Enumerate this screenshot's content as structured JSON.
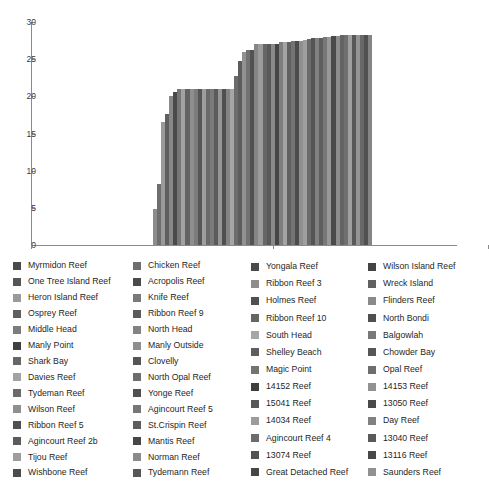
{
  "chart_data": {
    "type": "bar",
    "title": "",
    "subtitle": "",
    "xlabel": "",
    "ylabel": "",
    "ylim": [
      0,
      30
    ],
    "yticks": [
      0,
      5,
      10,
      15,
      20,
      25,
      30
    ],
    "grid": false,
    "legend_position": "bottom",
    "legend_columns": 4,
    "x_axis_tick_positions": [
      0,
      242,
      457
    ],
    "categories": [
      "Myrmidon Reef",
      "One Tree Island Reef",
      "Heron Island Reef",
      "Osprey Reef",
      "Middle Head",
      "Manly Point",
      "Shark Bay",
      "Davies Reef",
      "Tydeman Reef",
      "Wilson Reef",
      "Ribbon Reef 5",
      "Agincourt Reef 2b",
      "Tijou Reef",
      "Wishbone Reef",
      "Chicken Reef",
      "Acropolis Reef",
      "Knife Reef",
      "Ribbon Reef 9",
      "North Head",
      "Manly Outside",
      "Clovelly",
      "North Opal Reef",
      "Yonge Reef",
      "Agincourt Reef 5",
      "St.Crispin Reef",
      "Mantis Reef",
      "Norman Reef",
      "Tydemann Reef",
      "Yongala Reef",
      "Ribbon Reef 3",
      "Holmes Reef",
      "Ribbon Reef 10",
      "South Head",
      "Shelley Beach",
      "Magic Point",
      "14152 Reef",
      "15041 Reef",
      "14034 Reef",
      "Agincourt Reef 4",
      "13074 Reef",
      "Great Detached Reef",
      "Wilson Island Reef",
      "Wreck Island",
      "Flinders Reef",
      "North Bondi",
      "Balgowlah",
      "Chowder Bay",
      "Opal Reef",
      "14153 Reef",
      "13050 Reef",
      "Day Reef",
      "13040 Reef",
      "13116 Reef",
      "Saunders Reef"
    ],
    "values": [
      4.9,
      8.2,
      16.5,
      17.6,
      20.1,
      20.6,
      21.0,
      21.0,
      21.0,
      21.0,
      21.0,
      21.0,
      21.0,
      21.0,
      21.0,
      21.0,
      21.0,
      21.0,
      21.0,
      21.0,
      22.7,
      24.7,
      26.0,
      26.2,
      26.2,
      27.1,
      27.1,
      27.1,
      27.1,
      27.1,
      27.1,
      27.3,
      27.3,
      27.3,
      27.4,
      27.4,
      27.5,
      27.6,
      27.7,
      27.8,
      27.9,
      27.9,
      28.0,
      28.0,
      28.1,
      28.1,
      28.2,
      28.2,
      28.2,
      28.2,
      28.2,
      28.2,
      28.2,
      28.2
    ],
    "bar_colors": [
      "#8c8c8c",
      "#6e6e6e",
      "#9a9a9a",
      "#5f5f5f",
      "#888888",
      "#4a4a4a",
      "#767676",
      "#a2a2a2",
      "#636363",
      "#8f8f8f",
      "#7c7c7c",
      "#565656",
      "#9e9e9e",
      "#6a6a6a",
      "#7a7a7a",
      "#5b5b5b",
      "#969696",
      "#4f4f4f",
      "#838383",
      "#a6a6a6",
      "#6d6d6d",
      "#5d5d5d",
      "#929292",
      "#727272",
      "#525252",
      "#868686",
      "#9c9c9c",
      "#666666",
      "#595959",
      "#8a8a8a",
      "#464646",
      "#7e7e7e",
      "#a4a4a4",
      "#616161",
      "#747474",
      "#4c4c4c",
      "#909090",
      "#9f9f9f",
      "#6b6b6b",
      "#545454",
      "#818181",
      "#5e5e5e",
      "#787878",
      "#989898",
      "#4a4a4a",
      "#8d8d8d",
      "#636363",
      "#707070",
      "#a0a0a0",
      "#585858",
      "#949494",
      "#686868",
      "#505050",
      "#858585"
    ]
  },
  "legend": {
    "columns": [
      {
        "items": [
          {
            "label": "Myrmidon Reef",
            "color": "#4a4a4a"
          },
          {
            "label": "One Tree Island Reef",
            "color": "#555555"
          },
          {
            "label": "Heron Island Reef",
            "color": "#9a9a9a"
          },
          {
            "label": "Osprey Reef",
            "color": "#5f5f5f"
          },
          {
            "label": "Middle Head",
            "color": "#7c7c7c"
          },
          {
            "label": "Manly Point",
            "color": "#3f3f3f"
          },
          {
            "label": "Shark Bay",
            "color": "#666666"
          },
          {
            "label": "Davies Reef",
            "color": "#a2a2a2"
          },
          {
            "label": "Tydeman Reef",
            "color": "#6a6a6a"
          },
          {
            "label": "Wilson Reef",
            "color": "#8f8f8f"
          },
          {
            "label": "Ribbon Reef 5",
            "color": "#4f4f4f"
          },
          {
            "label": "Agincourt Reef 2b",
            "color": "#5b5b5b"
          },
          {
            "label": "Tijou Reef",
            "color": "#9e9e9e"
          },
          {
            "label": "Wishbone Reef",
            "color": "#4c4c4c"
          }
        ]
      },
      {
        "items": [
          {
            "label": "Chicken Reef",
            "color": "#6e6e6e"
          },
          {
            "label": "Acropolis Reef",
            "color": "#4a4a4a"
          },
          {
            "label": "Knife Reef",
            "color": "#7a7a7a"
          },
          {
            "label": "Ribbon Reef 9",
            "color": "#5b5b5b"
          },
          {
            "label": "North Head",
            "color": "#838383"
          },
          {
            "label": "Manly Outside",
            "color": "#8e8e8e"
          },
          {
            "label": "Clovelly",
            "color": "#555555"
          },
          {
            "label": "North Opal Reef",
            "color": "#6d6d6d"
          },
          {
            "label": "Yonge Reef",
            "color": "#505050"
          },
          {
            "label": "Agincourt Reef 5",
            "color": "#767676"
          },
          {
            "label": "St.Crispin Reef",
            "color": "#5d5d5d"
          },
          {
            "label": "Mantis Reef",
            "color": "#474747"
          },
          {
            "label": "Norman Reef",
            "color": "#8a8a8a"
          },
          {
            "label": "Tydemann Reef",
            "color": "#565656"
          }
        ]
      },
      {
        "items": [
          {
            "label": "Yongala Reef",
            "color": "#4a4a4a"
          },
          {
            "label": "Ribbon Reef 3",
            "color": "#8d8d8d"
          },
          {
            "label": "Holmes Reef",
            "color": "#505050"
          },
          {
            "label": "Ribbon Reef 10",
            "color": "#666666"
          },
          {
            "label": "South Head",
            "color": "#a6a6a6"
          },
          {
            "label": "Shelley Beach",
            "color": "#5e5e5e"
          },
          {
            "label": "Magic Point",
            "color": "#747474"
          },
          {
            "label": "14152 Reef",
            "color": "#3f3f3f"
          },
          {
            "label": "15041 Reef",
            "color": "#585858"
          },
          {
            "label": "14034 Reef",
            "color": "#9c9c9c"
          },
          {
            "label": "Agincourt Reef 4",
            "color": "#6b6b6b"
          },
          {
            "label": "13074 Reef",
            "color": "#525252"
          },
          {
            "label": "Great Detached Reef",
            "color": "#464646"
          }
        ]
      },
      {
        "items": [
          {
            "label": "Wilson Island Reef",
            "color": "#444444"
          },
          {
            "label": "Wreck Island",
            "color": "#616161"
          },
          {
            "label": "Flinders Reef",
            "color": "#8a8a8a"
          },
          {
            "label": "North Bondi",
            "color": "#4f4f4f"
          },
          {
            "label": "Balgowlah",
            "color": "#787878"
          },
          {
            "label": "Chowder Bay",
            "color": "#565656"
          },
          {
            "label": "Opal Reef",
            "color": "#6e6e6e"
          },
          {
            "label": "14153 Reef",
            "color": "#929292"
          },
          {
            "label": "13050 Reef",
            "color": "#4a4a4a"
          },
          {
            "label": "Day Reef",
            "color": "#818181"
          },
          {
            "label": "13040 Reef",
            "color": "#5a5a5a"
          },
          {
            "label": "13116 Reef",
            "color": "#484848"
          },
          {
            "label": "Saunders Reef",
            "color": "#909090"
          }
        ]
      }
    ]
  },
  "axis": {
    "color": "#8a8a8a",
    "tick_label_color": "#3a3a3a"
  }
}
